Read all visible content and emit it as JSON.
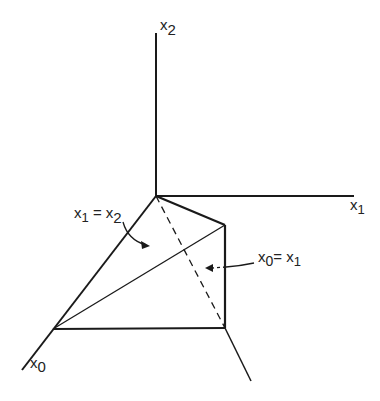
{
  "diagram": {
    "axes": {
      "x0": {
        "label": "x",
        "sub": "0"
      },
      "x1": {
        "label": "x",
        "sub": "1"
      },
      "x2": {
        "label": "x",
        "sub": "2"
      }
    },
    "annotations": {
      "plane_x1_x2": {
        "lhs": "x",
        "lhs_sub": "1",
        "eq": " = ",
        "rhs": "x",
        "rhs_sub": "2"
      },
      "plane_x0_x1": {
        "lhs": "x",
        "lhs_sub": "0",
        "eq": "= ",
        "rhs": "x",
        "rhs_sub": "1"
      }
    },
    "colors": {
      "stroke": "#1a1a1a"
    }
  }
}
